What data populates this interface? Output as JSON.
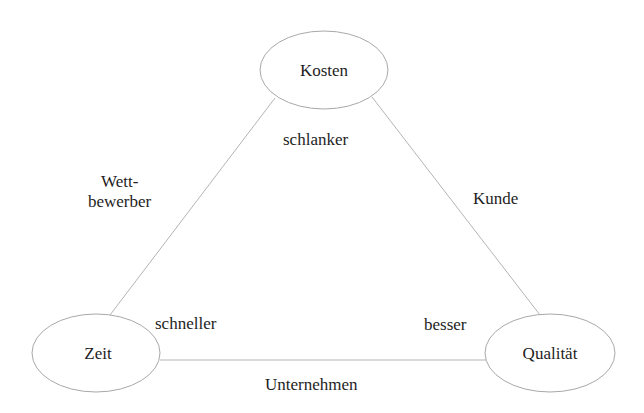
{
  "diagram": {
    "type": "triangle-concept-map",
    "colors": {
      "stroke": "#a8a8a8",
      "text": "#1e1e1e",
      "background": "#ffffff"
    },
    "nodes": [
      {
        "id": "kosten",
        "label": "Kosten"
      },
      {
        "id": "zeit",
        "label": "Zeit"
      },
      {
        "id": "qualitaet",
        "label": "Qualität"
      }
    ],
    "edges": [
      {
        "from": "kosten",
        "to": "zeit",
        "label": "Wett-\nbewerber"
      },
      {
        "from": "kosten",
        "to": "qualitaet",
        "label": "Kunde"
      },
      {
        "from": "zeit",
        "to": "qualitaet",
        "label": "Unternehmen"
      }
    ],
    "corner_labels": {
      "kosten": "schlanker",
      "zeit": "schneller",
      "qualitaet": "besser"
    }
  }
}
